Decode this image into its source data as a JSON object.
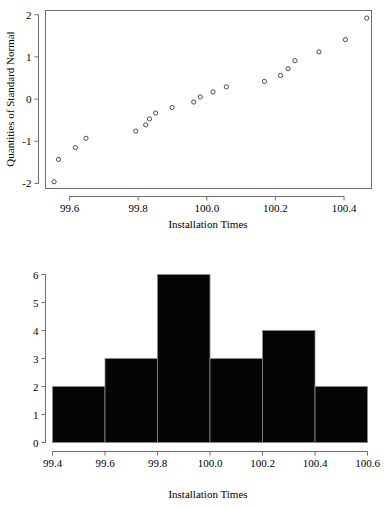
{
  "figure": {
    "title": "",
    "background_color": "#ffffff"
  },
  "chart_data": [
    {
      "type": "scatter",
      "name": "normal-quantile-plot",
      "title": "",
      "xlabel": "Installation Times",
      "ylabel": "Quantities of Standard Normal",
      "xlim": [
        99.53,
        100.48
      ],
      "ylim": [
        -2.12,
        2.1
      ],
      "xticks": [
        99.6,
        99.8,
        100.0,
        100.2,
        100.4
      ],
      "xticklabels": [
        "99.6",
        "99.8",
        "100.0",
        "100.2",
        "100.4"
      ],
      "yticks": [
        -2,
        -1,
        0,
        1,
        2
      ],
      "yticklabels": [
        "-2",
        "-1",
        "0",
        "1",
        "2"
      ],
      "grid": false,
      "legend": "none",
      "marker": "open-circle",
      "marker_color": "#4a4a4a",
      "points": [
        {
          "x": 99.555,
          "y": -1.96
        },
        {
          "x": 99.568,
          "y": -1.43
        },
        {
          "x": 99.617,
          "y": -1.15
        },
        {
          "x": 99.648,
          "y": -0.93
        },
        {
          "x": 99.793,
          "y": -0.76
        },
        {
          "x": 99.822,
          "y": -0.61
        },
        {
          "x": 99.833,
          "y": -0.47
        },
        {
          "x": 99.851,
          "y": -0.33
        },
        {
          "x": 99.899,
          "y": -0.2
        },
        {
          "x": 99.962,
          "y": -0.07
        },
        {
          "x": 99.981,
          "y": 0.05
        },
        {
          "x": 100.018,
          "y": 0.17
        },
        {
          "x": 100.057,
          "y": 0.29
        },
        {
          "x": 100.168,
          "y": 0.42
        },
        {
          "x": 100.215,
          "y": 0.56
        },
        {
          "x": 100.237,
          "y": 0.72
        },
        {
          "x": 100.257,
          "y": 0.91
        },
        {
          "x": 100.327,
          "y": 1.12
        },
        {
          "x": 100.404,
          "y": 1.41
        },
        {
          "x": 100.466,
          "y": 1.92
        }
      ]
    },
    {
      "type": "bar",
      "name": "installation-times-histogram",
      "title": "",
      "xlabel": "Installation Times",
      "ylabel": "",
      "xlim": [
        99.4,
        100.6
      ],
      "ylim": [
        0,
        6
      ],
      "xticks": [
        99.4,
        99.6,
        99.8,
        100.0,
        100.2,
        100.4,
        100.6
      ],
      "xticklabels": [
        "99.4",
        "99.6",
        "99.8",
        "100.0",
        "100.2",
        "100.4",
        "100.6"
      ],
      "yticks": [
        0,
        1,
        2,
        3,
        4,
        5,
        6
      ],
      "yticklabels": [
        "0",
        "1",
        "2",
        "3",
        "4",
        "5",
        "6"
      ],
      "grid": false,
      "legend": "none",
      "bar_color": "#050505",
      "bin_edges": [
        99.4,
        99.6,
        99.8,
        100.0,
        100.2,
        100.4,
        100.6
      ],
      "categories": [
        "99.4-99.6",
        "99.6-99.8",
        "99.8-100.0",
        "100.0-100.2",
        "100.2-100.4",
        "100.4-100.6"
      ],
      "values": [
        2,
        3,
        6,
        3,
        4,
        2
      ]
    }
  ]
}
